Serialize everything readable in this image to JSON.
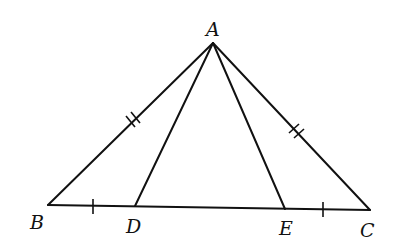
{
  "diagram": {
    "type": "triangle",
    "points": {
      "A": {
        "label": "A",
        "x": 213,
        "y": 43
      },
      "B": {
        "label": "B",
        "x": 48,
        "y": 205
      },
      "C": {
        "label": "C",
        "x": 370,
        "y": 210
      },
      "D": {
        "label": "D",
        "x": 135,
        "y": 206
      },
      "E": {
        "label": "E",
        "x": 285,
        "y": 209
      }
    },
    "segments": [
      "AB",
      "AC",
      "BC",
      "AD",
      "AE"
    ],
    "equal_marks": [
      {
        "segments": [
          "AB",
          "AC"
        ],
        "ticks": 2
      },
      {
        "segments": [
          "BD",
          "EC"
        ],
        "ticks": 1
      }
    ],
    "stroke_color": "#111111"
  }
}
